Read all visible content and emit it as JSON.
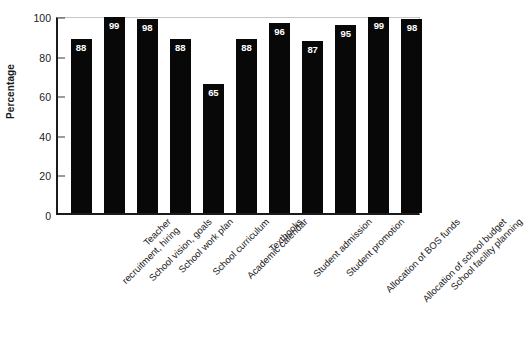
{
  "chart_data": {
    "type": "bar",
    "title": "",
    "xlabel": "",
    "ylabel": "Percentage",
    "ylim": [
      0,
      100
    ],
    "yticks": [
      0,
      20,
      40,
      60,
      80,
      100
    ],
    "grid": false,
    "legend": "none",
    "bar_color": "#080808",
    "value_label_color": "#ffffff",
    "categories": [
      "Teacher recruitment, hiring",
      "School vision, goals",
      "School work plan",
      "School curriculum",
      "Academic calendar",
      "Textbooks",
      "Student admission",
      "Student promotion",
      "Allocation of BOS funds",
      "Allocation of school budget",
      "School facility planning"
    ],
    "category_lines": [
      [
        "Teacher",
        "recruitment, hiring"
      ],
      [
        "School vision, goals",
        ""
      ],
      [
        "School work plan",
        ""
      ],
      [
        "School curriculum",
        ""
      ],
      [
        "Academic calendar",
        ""
      ],
      [
        "Textbooks",
        ""
      ],
      [
        "Student admission",
        ""
      ],
      [
        "Student promotion",
        ""
      ],
      [
        "Allocation of BOS funds",
        ""
      ],
      [
        "Allocation of school budget",
        ""
      ],
      [
        "School facility planning",
        ""
      ]
    ],
    "values": [
      88,
      99,
      98,
      88,
      65,
      88,
      96,
      87,
      95,
      99,
      98
    ]
  },
  "axis": {
    "y_title": "Percentage",
    "y_tick_labels": [
      "0",
      "20",
      "40",
      "60",
      "80",
      "100"
    ]
  }
}
